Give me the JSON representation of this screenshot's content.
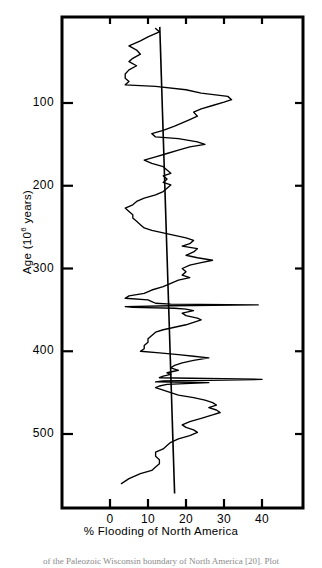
{
  "figure": {
    "caption_fragment": "of the Paleozoic Wisconsin boundary of North America [20]. Plot"
  },
  "chart_data": {
    "type": "line",
    "title": "",
    "xlabel": "% Flooding of North America",
    "ylabel": "Age (10⁶ years)",
    "ylabel_base": "Age (10",
    "ylabel_exp": "6",
    "ylabel_tail": " years)",
    "xlim": [
      -5,
      45
    ],
    "ylim": [
      8,
      572
    ],
    "y_inverted": true,
    "grid": false,
    "legend": "none",
    "xticks": [
      0,
      10,
      20,
      30,
      40
    ],
    "xtick_labels": [
      "0",
      "10",
      "20",
      "30",
      "40"
    ],
    "yticks": [
      100,
      200,
      300,
      400,
      500
    ],
    "ytick_labels": [
      "100",
      "200",
      "300",
      "400",
      "500"
    ],
    "series": [
      {
        "name": "% Flooding of North America",
        "x_is_value": true,
        "points": [
          [
            12,
            10
          ],
          [
            13,
            14
          ],
          [
            10,
            20
          ],
          [
            8,
            25
          ],
          [
            5,
            31
          ],
          [
            7,
            36
          ],
          [
            8,
            41
          ],
          [
            6,
            46
          ],
          [
            5,
            50
          ],
          [
            7,
            55
          ],
          [
            5,
            60
          ],
          [
            4,
            65
          ],
          [
            4,
            70
          ],
          [
            5,
            74
          ],
          [
            4,
            78
          ],
          [
            12,
            80
          ],
          [
            20,
            84
          ],
          [
            24,
            88
          ],
          [
            31,
            92
          ],
          [
            32,
            96
          ],
          [
            30,
            99
          ],
          [
            27,
            103
          ],
          [
            24,
            107
          ],
          [
            22,
            111
          ],
          [
            23,
            116
          ],
          [
            21,
            120
          ],
          [
            19,
            124
          ],
          [
            17,
            128
          ],
          [
            14,
            133
          ],
          [
            11,
            137
          ],
          [
            12,
            141
          ],
          [
            18,
            143
          ],
          [
            23,
            147
          ],
          [
            25,
            150
          ],
          [
            21,
            153
          ],
          [
            18,
            157
          ],
          [
            15,
            161
          ],
          [
            12,
            165
          ],
          [
            9,
            169
          ],
          [
            11,
            173
          ],
          [
            14,
            177
          ],
          [
            15,
            181
          ],
          [
            16,
            185
          ],
          [
            14,
            188
          ],
          [
            15,
            192
          ],
          [
            14,
            196
          ],
          [
            16,
            199
          ],
          [
            15,
            203
          ],
          [
            14,
            207
          ],
          [
            12,
            211
          ],
          [
            9,
            215
          ],
          [
            7,
            219
          ],
          [
            6,
            223
          ],
          [
            4,
            227
          ],
          [
            5,
            231
          ],
          [
            6,
            235
          ],
          [
            6,
            239
          ],
          [
            7,
            243
          ],
          [
            8,
            247
          ],
          [
            9,
            251
          ],
          [
            11,
            254
          ],
          [
            14,
            257
          ],
          [
            17,
            260
          ],
          [
            20,
            263
          ],
          [
            22,
            266
          ],
          [
            21,
            270
          ],
          [
            19,
            273
          ],
          [
            23,
            276
          ],
          [
            22,
            280
          ],
          [
            20,
            284
          ],
          [
            23,
            287
          ],
          [
            27,
            290
          ],
          [
            24,
            293
          ],
          [
            21,
            296
          ],
          [
            19,
            300
          ],
          [
            20,
            304
          ],
          [
            19,
            308
          ],
          [
            21,
            311
          ],
          [
            18,
            314
          ],
          [
            16,
            318
          ],
          [
            14,
            322
          ],
          [
            11,
            326
          ],
          [
            9,
            330
          ],
          [
            5,
            333
          ],
          [
            4,
            336
          ],
          [
            10,
            338
          ],
          [
            11,
            340
          ],
          [
            12,
            342
          ],
          [
            16,
            343
          ],
          [
            39,
            344
          ],
          [
            16,
            345
          ],
          [
            4,
            346
          ],
          [
            6,
            347
          ],
          [
            17,
            348
          ],
          [
            20,
            349
          ],
          [
            22,
            351
          ],
          [
            19,
            354
          ],
          [
            20,
            357
          ],
          [
            23,
            360
          ],
          [
            24,
            362
          ],
          [
            22,
            365
          ],
          [
            20,
            368
          ],
          [
            17,
            371
          ],
          [
            14,
            374
          ],
          [
            12,
            377
          ],
          [
            11,
            381
          ],
          [
            10,
            385
          ],
          [
            10,
            389
          ],
          [
            9,
            393
          ],
          [
            9,
            397
          ],
          [
            8,
            400
          ],
          [
            13,
            402
          ],
          [
            18,
            404
          ],
          [
            22,
            406
          ],
          [
            26,
            408
          ],
          [
            22,
            411
          ],
          [
            19,
            414
          ],
          [
            17,
            417
          ],
          [
            16,
            420
          ],
          [
            18,
            423
          ],
          [
            15,
            426
          ],
          [
            16,
            428
          ],
          [
            14,
            430
          ],
          [
            13,
            432
          ],
          [
            40,
            434
          ],
          [
            14,
            436
          ],
          [
            12,
            437
          ],
          [
            26,
            438
          ],
          [
            15,
            440
          ],
          [
            13,
            442
          ],
          [
            12,
            444
          ],
          [
            14,
            447
          ],
          [
            16,
            450
          ],
          [
            18,
            453
          ],
          [
            22,
            456
          ],
          [
            25,
            459
          ],
          [
            27,
            462
          ],
          [
            28,
            465
          ],
          [
            26,
            468
          ],
          [
            28,
            471
          ],
          [
            29,
            474
          ],
          [
            27,
            477
          ],
          [
            24,
            481
          ],
          [
            21,
            485
          ],
          [
            19,
            489
          ],
          [
            20,
            492
          ],
          [
            22,
            495
          ],
          [
            23,
            498
          ],
          [
            21,
            502
          ],
          [
            18,
            506
          ],
          [
            16,
            510
          ],
          [
            15,
            514
          ],
          [
            14,
            518
          ],
          [
            12,
            522
          ],
          [
            12,
            527
          ],
          [
            13,
            531
          ],
          [
            13,
            536
          ],
          [
            12,
            540
          ],
          [
            11,
            544
          ],
          [
            8,
            548
          ],
          [
            5,
            554
          ],
          [
            3,
            560
          ]
        ]
      },
      {
        "name": "trend-line",
        "type": "straight",
        "points": [
          [
            13.1,
            8
          ],
          [
            17.0,
            572
          ]
        ]
      }
    ]
  }
}
